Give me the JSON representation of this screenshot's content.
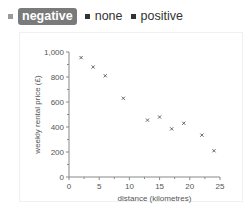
{
  "legend": {
    "items": [
      {
        "label": "negative",
        "active": true
      },
      {
        "label": "none",
        "active": false
      },
      {
        "label": "positive",
        "active": false
      }
    ]
  },
  "chart_data": {
    "type": "scatter",
    "title": "",
    "xlabel": "distance (kilometres)",
    "ylabel": "weekly rental price (£)",
    "xlim": [
      0,
      25
    ],
    "ylim": [
      0,
      1000
    ],
    "x_ticks": [
      "0",
      "5",
      "10",
      "15",
      "20",
      "25"
    ],
    "y_ticks": [
      "0",
      "200",
      "400",
      "600",
      "800",
      "1,000"
    ],
    "grid": false,
    "marker": "x",
    "series": [
      {
        "name": "negative",
        "x": [
          2,
          4,
          6,
          9,
          13,
          15,
          17,
          19,
          22,
          24
        ],
        "y": [
          955,
          880,
          810,
          630,
          455,
          480,
          385,
          430,
          335,
          210
        ]
      }
    ]
  }
}
